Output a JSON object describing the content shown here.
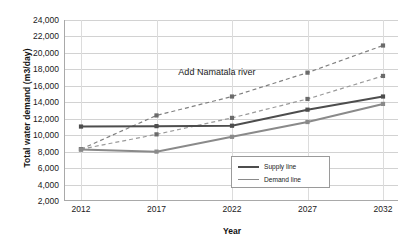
{
  "chart_data": {
    "type": "line",
    "title": "",
    "xlabel": "Year",
    "ylabel": "Total water demand (m3/day)",
    "categories": [
      "2012",
      "2017",
      "2022",
      "2027",
      "2032"
    ],
    "x": [
      2012,
      2017,
      2022,
      2027,
      2032
    ],
    "ylim": [
      2000,
      24000
    ],
    "ytick_labels": [
      "24,000",
      "22,000",
      "20,000",
      "18,000",
      "16,000",
      "14,000",
      "12,000",
      "10,000",
      "8,000",
      "6,000",
      "4,000",
      "2,000"
    ],
    "ytick_values": [
      24000,
      22000,
      20000,
      18000,
      16000,
      14000,
      12000,
      10000,
      8000,
      6000,
      4000,
      2000
    ],
    "grid": true,
    "legend_position": "inside-bottom-center",
    "annotations": [
      {
        "text": "Add Namatala river",
        "x": 2021,
        "y": 17600
      }
    ],
    "series": [
      {
        "name": "Demand line (high growth)",
        "style": "dashed",
        "color": "#808080",
        "values": [
          8300,
          12400,
          14700,
          17600,
          20900
        ]
      },
      {
        "name": "Demand line (low growth)",
        "style": "dashed",
        "color": "#9a9a9a",
        "values": [
          8300,
          10100,
          12100,
          14400,
          17200
        ]
      },
      {
        "name": "Supply line (with Namatala)",
        "style": "solid",
        "color": "#4d4d4d",
        "values": [
          11050,
          11100,
          11150,
          13100,
          14700
        ]
      },
      {
        "name": "Supply line (existing)",
        "style": "solid",
        "color": "#8a8a8a",
        "values": [
          8250,
          8000,
          9800,
          11600,
          13800
        ]
      }
    ]
  },
  "legend": {
    "items": [
      {
        "label": "Supply line",
        "key": "supply"
      },
      {
        "label": "Demand line",
        "key": "demand"
      }
    ]
  }
}
